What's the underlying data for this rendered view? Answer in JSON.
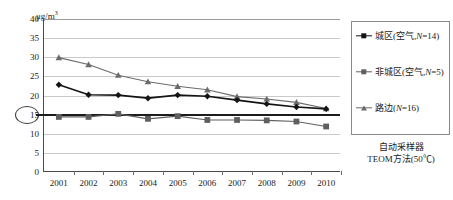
{
  "chart_data": {
    "type": "line",
    "title": "",
    "subtitle": "",
    "xlabel": "",
    "ylabel": "μg/m³",
    "unit_label": "μg/m",
    "unit_exponent": "3",
    "categories": [
      "2001",
      "2002",
      "2003",
      "2004",
      "2005",
      "2006",
      "2007",
      "2008",
      "2009",
      "2010"
    ],
    "ylim": [
      0,
      40
    ],
    "ytick_values": [
      0,
      5,
      10,
      15,
      20,
      25,
      30,
      35,
      40
    ],
    "ytick_labels": [
      "0",
      "5",
      "10",
      "15",
      "20",
      "25",
      "30",
      "35",
      "40"
    ],
    "grid": true,
    "legend_position": "right",
    "highlighted_ytick": "15",
    "reference_line": {
      "value": 15,
      "label": "15"
    },
    "series": [
      {
        "name": "城区(空气,N=14)",
        "name_prefix": "城区(空气,",
        "name_italic": "N",
        "name_suffix": "=14)",
        "marker": "diamond",
        "color": "#141414",
        "values": [
          22.8,
          20.2,
          20.1,
          19.3,
          20.1,
          19.8,
          18.8,
          17.8,
          17.0,
          16.5
        ]
      },
      {
        "name": "非城区(空气,N=5)",
        "name_prefix": "非城区(空气,",
        "name_italic": "N",
        "name_suffix": "=5)",
        "marker": "square",
        "color": "#5f5f5f",
        "values": [
          14.4,
          14.4,
          15.2,
          13.9,
          14.6,
          13.6,
          13.6,
          13.5,
          13.2,
          11.9
        ]
      },
      {
        "name": "路边(N=16)",
        "name_prefix": "路边(",
        "name_italic": "N",
        "name_suffix": "=16)",
        "marker": "triangle",
        "color": "#6b6b6b",
        "values": [
          29.9,
          28.1,
          25.3,
          23.6,
          22.4,
          21.5,
          19.7,
          19.1,
          18.2,
          16.6
        ]
      }
    ],
    "footer_lines": [
      "自动采样器",
      "TEOM方法(50℃)"
    ]
  }
}
